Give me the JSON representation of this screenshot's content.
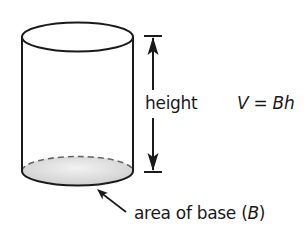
{
  "figure": {
    "type": "cylinder-volume-diagram",
    "labels": {
      "height": "height",
      "base": "area of base (B)",
      "base_prefix": "area of base (",
      "base_var": "B",
      "base_suffix": ")"
    },
    "formula": {
      "text": "V = Bh",
      "lhs": "V",
      "eq": "=",
      "rhs": "Bh"
    },
    "colors": {
      "stroke": "#1a1a1a",
      "dashed": "#666666",
      "base_fill": "#d9d9d9"
    }
  }
}
